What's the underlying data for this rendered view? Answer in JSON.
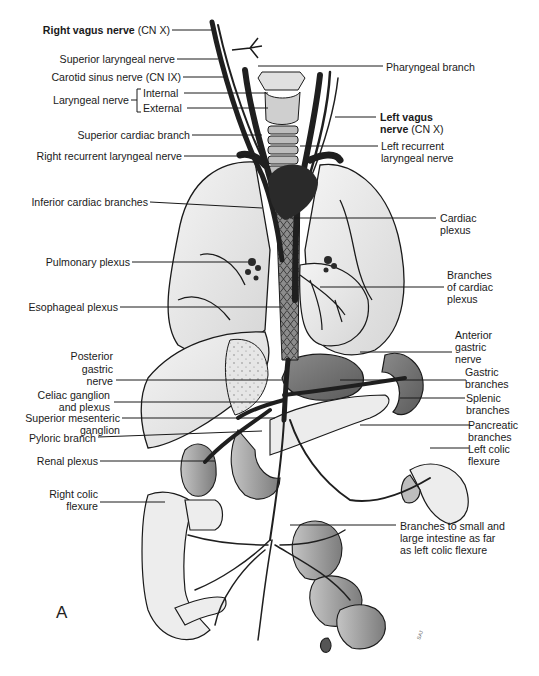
{
  "figure": {
    "panel_letter": "A",
    "accent_colors": {
      "line": "#1a1a1a",
      "nerve_fill": "#2a2a2a",
      "organ_shade": "#9a9a9a",
      "organ_light": "#efefef"
    }
  },
  "labels_left": [
    {
      "id": "right-vagus",
      "bold": "Right vagus nerve",
      "text": " (CN X)"
    },
    {
      "id": "superior-laryngeal",
      "text": "Superior laryngeal nerve"
    },
    {
      "id": "carotid-sinus",
      "text": "Carotid sinus nerve (CN IX)"
    },
    {
      "id": "laryngeal",
      "text": "Laryngeal nerve"
    },
    {
      "id": "laryngeal-internal",
      "text": "Internal"
    },
    {
      "id": "laryngeal-external",
      "text": "External"
    },
    {
      "id": "superior-cardiac",
      "text": "Superior cardiac branch"
    },
    {
      "id": "right-recurrent",
      "text": "Right recurrent laryngeal nerve"
    },
    {
      "id": "inferior-cardiac",
      "text": "Inferior cardiac branches"
    },
    {
      "id": "pulmonary-plexus",
      "text": "Pulmonary plexus"
    },
    {
      "id": "esophageal-plexus",
      "text": "Esophageal plexus"
    },
    {
      "id": "posterior-gastric",
      "lines": [
        "Posterior",
        "gastric",
        "nerve"
      ]
    },
    {
      "id": "celiac",
      "lines": [
        "Celiac ganglion",
        "and plexus"
      ]
    },
    {
      "id": "superior-mesenteric",
      "lines": [
        "Superior mesenteric",
        "ganglion"
      ]
    },
    {
      "id": "pyloric",
      "text": "Pyloric branch"
    },
    {
      "id": "renal",
      "text": "Renal plexus"
    },
    {
      "id": "right-colic",
      "lines": [
        "Right colic",
        "flexure"
      ]
    }
  ],
  "labels_right": [
    {
      "id": "pharyngeal",
      "text": "Pharyngeal branch"
    },
    {
      "id": "left-vagus",
      "bold_lines": [
        "Left vagus",
        "nerve"
      ],
      "text": " (CN X)"
    },
    {
      "id": "left-recurrent",
      "lines": [
        "Left recurrent",
        "laryngeal nerve"
      ]
    },
    {
      "id": "cardiac-plexus",
      "lines": [
        "Cardiac",
        "plexus"
      ]
    },
    {
      "id": "branches-cardiac",
      "lines": [
        "Branches",
        "of cardiac",
        "plexus"
      ]
    },
    {
      "id": "anterior-gastric",
      "lines": [
        "Anterior",
        "gastric",
        "nerve"
      ]
    },
    {
      "id": "gastric-branches",
      "lines": [
        "Gastric",
        "branches"
      ]
    },
    {
      "id": "splenic-branches",
      "lines": [
        "Splenic",
        "branches"
      ]
    },
    {
      "id": "pancreatic-branches",
      "lines": [
        "Pancreatic",
        "branches"
      ]
    },
    {
      "id": "left-colic",
      "lines": [
        "Left colic",
        "flexure"
      ]
    },
    {
      "id": "intestine-branches",
      "lines": [
        "Branches to small and",
        "large intestine as far",
        "as left colic flexure"
      ]
    }
  ]
}
